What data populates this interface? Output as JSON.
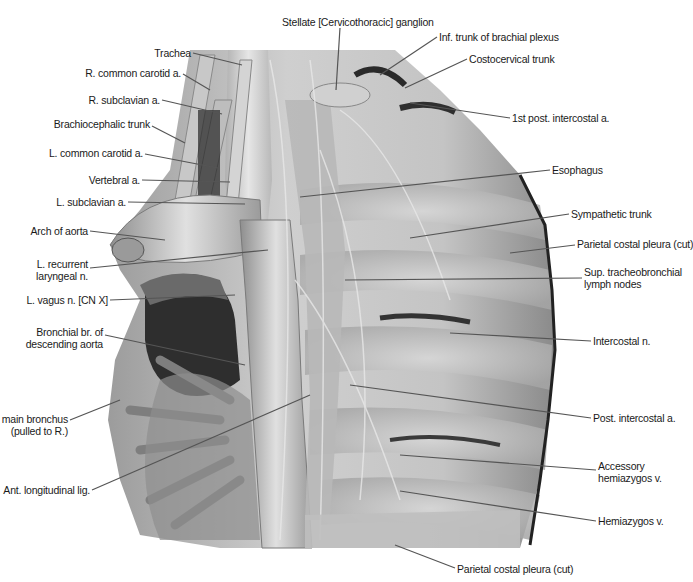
{
  "figure": {
    "colors": {
      "background": "#ffffff",
      "tissue_light": "#d6d6d6",
      "tissue_mid": "#a8a8a8",
      "tissue_dark": "#3a3a3a",
      "leader_line": "#555555",
      "label_text": "#1a1a1a"
    },
    "labels": [
      {
        "id": "stellate-ganglion",
        "text": "Stellate [Cervicothoracic] ganglion",
        "x": 282,
        "y": 16,
        "side": "right",
        "line": [
          340,
          28,
          336,
          90
        ]
      },
      {
        "id": "inf-trunk-brachial-plexus",
        "text": "Inf. trunk of brachial plexus",
        "x": 439,
        "y": 31,
        "side": "right",
        "line": [
          437,
          37,
          380,
          75
        ]
      },
      {
        "id": "costocervical-trunk",
        "text": "Costocervical trunk",
        "x": 469,
        "y": 53,
        "side": "right",
        "line": [
          467,
          59,
          405,
          88
        ]
      },
      {
        "id": "1st-post-intercostal-a",
        "text": "1st post. intercostal a.",
        "x": 512,
        "y": 112,
        "side": "right",
        "line": [
          510,
          118,
          410,
          103
        ]
      },
      {
        "id": "trachea",
        "text": "Trachea",
        "x": 130,
        "y": 47,
        "side": "left",
        "line": [
          193,
          53,
          242,
          65
        ]
      },
      {
        "id": "r-common-carotid-a",
        "text": "R. common carotid a.",
        "x": 40,
        "y": 67,
        "side": "left",
        "line": [
          183,
          74,
          210,
          90
        ]
      },
      {
        "id": "r-subclavian-a",
        "text": "R. subclavian a.",
        "x": 40,
        "y": 94,
        "side": "left",
        "line": [
          162,
          100,
          222,
          114
        ]
      },
      {
        "id": "brachiocephalic-trunk",
        "text": "Brachiocephalic trunk",
        "x": 40,
        "y": 118,
        "side": "left",
        "line": [
          152,
          126,
          185,
          143
        ]
      },
      {
        "id": "l-common-carotid-a",
        "text": "L. common carotid a.",
        "x": 40,
        "y": 147,
        "side": "left",
        "line": [
          145,
          154,
          218,
          168
        ]
      },
      {
        "id": "vertebral-a",
        "text": "Vertebral a.",
        "x": 40,
        "y": 174,
        "side": "left",
        "line": [
          142,
          180,
          230,
          182
        ]
      },
      {
        "id": "esophagus",
        "text": "Esophagus",
        "x": 552,
        "y": 164,
        "side": "right",
        "line": [
          550,
          170,
          300,
          197
        ]
      },
      {
        "id": "l-subclavian-a",
        "text": "L. subclavian a.",
        "x": 40,
        "y": 196,
        "side": "left",
        "line": [
          128,
          202,
          245,
          204
        ]
      },
      {
        "id": "sympathetic-trunk",
        "text": "Sympathetic trunk",
        "x": 571,
        "y": 208,
        "side": "right",
        "line": [
          569,
          214,
          410,
          238
        ]
      },
      {
        "id": "arch-of-aorta",
        "text": "Arch of aorta",
        "x": 40,
        "y": 225,
        "side": "left",
        "line": [
          90,
          231,
          165,
          240
        ]
      },
      {
        "id": "parietal-costal-pleura-cut-upper",
        "text": "Parietal costal pleura (cut)",
        "x": 577,
        "y": 238,
        "side": "right",
        "line": [
          575,
          245,
          510,
          253
        ]
      },
      {
        "id": "l-recurrent-laryngeal-n",
        "text": "L. recurrent\nlaryngeal n.",
        "x": 44,
        "y": 258,
        "side": "left",
        "line": [
          90,
          268,
          268,
          250
        ]
      },
      {
        "id": "sup-tracheobronchial-lymph-nodes",
        "text": "Sup. tracheobronchial\nlymph nodes",
        "x": 584,
        "y": 266,
        "side": "right",
        "line": [
          582,
          278,
          345,
          280
        ]
      },
      {
        "id": "l-vagus-n",
        "text": "L. vagus n. [CN X]",
        "x": 40,
        "y": 294,
        "side": "left",
        "line": [
          110,
          300,
          235,
          295
        ]
      },
      {
        "id": "bronchial-br-descending-aorta",
        "text": "Bronchial br. of\ndescending aorta",
        "x": 44,
        "y": 326,
        "side": "left",
        "line": [
          105,
          335,
          245,
          365
        ]
      },
      {
        "id": "intercostal-n",
        "text": "Intercostal n.",
        "x": 593,
        "y": 335,
        "side": "right",
        "line": [
          591,
          341,
          450,
          333
        ]
      },
      {
        "id": "l-main-bronchus",
        "text": "L. main bronchus\n(pulled to R.)",
        "x": 5,
        "y": 413,
        "side": "left",
        "line": [
          70,
          420,
          120,
          400
        ]
      },
      {
        "id": "post-intercostal-a",
        "text": "Post. intercostal a.",
        "x": 593,
        "y": 412,
        "side": "right",
        "line": [
          591,
          418,
          350,
          385
        ]
      },
      {
        "id": "ant-longitudinal-lig",
        "text": "Ant. longitudinal lig.",
        "x": 20,
        "y": 484,
        "side": "left",
        "line": [
          92,
          490,
          310,
          395
        ]
      },
      {
        "id": "accessory-hemiazygos-v",
        "text": "Accessory\nhemiazygos v.",
        "x": 598,
        "y": 460,
        "side": "right",
        "line": [
          596,
          470,
          400,
          455
        ]
      },
      {
        "id": "hemiazygos-v",
        "text": "Hemiazygos v.",
        "x": 598,
        "y": 515,
        "side": "right",
        "line": [
          596,
          521,
          400,
          491
        ]
      },
      {
        "id": "parietal-costal-pleura-cut-lower",
        "text": "Parietal costal pleura (cut)",
        "x": 457,
        "y": 563,
        "side": "right",
        "line": [
          455,
          568,
          395,
          545
        ]
      }
    ]
  }
}
